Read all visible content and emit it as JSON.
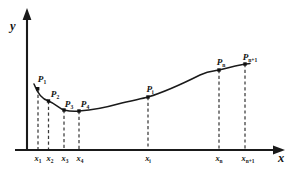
{
  "figure": {
    "background_color": "#ffffff",
    "ink_color": "#141414",
    "width": 295,
    "height": 176
  },
  "axes": {
    "y_axis_label": "y",
    "x_axis_label": "x",
    "origin_px": {
      "x": 27,
      "y": 150
    },
    "x_axis_end_px": 285,
    "y_axis_top_px": 10,
    "arrowheads": "both-axes"
  },
  "chart_data": {
    "type": "line",
    "title": "",
    "subtitle": "",
    "xlabel": "x",
    "ylabel": "y",
    "grid": false,
    "legend": "none",
    "axis_ticks_shown": "labels-only",
    "annotations": "Each data point P is labelled above the curve and connected to its x-axis tick by a vertical dashed line.",
    "x": [
      "x1",
      "x2",
      "x3",
      "x4",
      "xi",
      "xn",
      "xn+1"
    ],
    "x_tick_labels": [
      "x",
      "x",
      "x",
      "x",
      "x",
      "x",
      "x"
    ],
    "x_tick_subscripts": [
      "1",
      "2",
      "3",
      "4",
      "i",
      "n",
      "n+1"
    ],
    "point_labels": [
      "P",
      "P",
      "P",
      "P",
      "P",
      "P",
      "P"
    ],
    "point_subscripts": [
      "1",
      "2",
      "3",
      "4",
      "i",
      "n",
      "n+1"
    ],
    "x_px": [
      38,
      48.5,
      64,
      79,
      148,
      219,
      245
    ],
    "y_px": [
      89,
      101,
      110,
      111,
      97,
      70,
      64
    ],
    "values": [
      61,
      49,
      40,
      39,
      53,
      80,
      86
    ],
    "xlim_px": [
      27,
      285
    ],
    "ylim_px": [
      150,
      10
    ],
    "curve_shape": "smooth spline: descends from P1 to a flat minimum near P3-P4, then rises monotonically with an inflection toward Pn and flattens at Pn+1"
  },
  "points": [
    {
      "label": "P",
      "sub": "1",
      "x_px": 38,
      "y_px": 89,
      "label_x_px": 42,
      "label_y_px": 75,
      "tick_label_x_px": 38,
      "tick_sub": "1"
    },
    {
      "label": "P",
      "sub": "2",
      "x_px": 48.5,
      "y_px": 101,
      "label_x_px": 55,
      "label_y_px": 90,
      "tick_label_x_px": 49,
      "tick_sub": "2"
    },
    {
      "label": "P",
      "sub": "3",
      "x_px": 64,
      "y_px": 110,
      "label_x_px": 69,
      "label_y_px": 100,
      "tick_label_x_px": 64,
      "tick_sub": "3"
    },
    {
      "label": "P",
      "sub": "4",
      "x_px": 79,
      "y_px": 111,
      "label_x_px": 85,
      "label_y_px": 100,
      "tick_label_x_px": 79,
      "tick_sub": "4"
    },
    {
      "label": "P",
      "sub": "i",
      "x_px": 148,
      "y_px": 97,
      "label_x_px": 150,
      "label_y_px": 85,
      "tick_label_x_px": 148,
      "tick_sub": "i"
    },
    {
      "label": "P",
      "sub": "n",
      "x_px": 219,
      "y_px": 70,
      "label_x_px": 221,
      "label_y_px": 58,
      "tick_label_x_px": 219,
      "tick_sub": "n"
    },
    {
      "label": "P",
      "sub": "n+1",
      "x_px": 245,
      "y_px": 64,
      "label_x_px": 250,
      "label_y_px": 53,
      "tick_label_x_px": 247,
      "tick_sub": "n+1"
    }
  ],
  "curve_path_d": "M 34,84 C 37,92 41,99 48.5,101 C 56,104 60,109 64,110 C 70,111.4 75,111.4 79,111 C 92,110 104,108 118,104 C 131,100.5 141,99 148,97 C 168,91 186,82 200,75 C 210,70.4 214,71.2 219,70 C 228,67.5 238,65 250,63.4"
}
